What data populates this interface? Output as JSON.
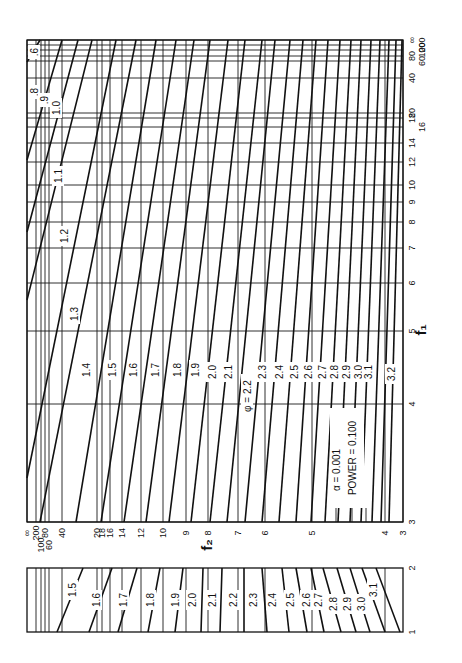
{
  "chart_data": {
    "type": "line",
    "orientation": "rotated 90° counter-clockwise",
    "annotation": {
      "alpha_label": "α = 0.001",
      "power_label": "POWER = 0.100"
    },
    "x_axis": {
      "label": "f₁",
      "scale": "log-like",
      "range": [
        3,
        "∞"
      ],
      "ticks": [
        "3",
        "4",
        "5",
        "6",
        "7",
        "8",
        "9",
        "10",
        "12",
        "14",
        "16",
        "18",
        "20",
        "40",
        "60",
        "80",
        "100",
        "200",
        "∞"
      ]
    },
    "y_axis": {
      "label": "f₂",
      "scale": "log-like",
      "range": [
        3,
        "∞"
      ],
      "ticks": [
        "∞",
        "200",
        "100",
        "80",
        "60",
        "40",
        "20",
        "18",
        "16",
        "14",
        "12",
        "10",
        "9",
        "8",
        "7",
        "6",
        "5",
        "4",
        "3"
      ]
    },
    "series_label_prefix": "φ =",
    "series": [
      {
        "name": "0.6"
      },
      {
        "name": "0.8"
      },
      {
        "name": "0.9"
      },
      {
        "name": "1.0"
      },
      {
        "name": "1.1"
      },
      {
        "name": "1.2"
      },
      {
        "name": "1.3"
      },
      {
        "name": "1.4"
      },
      {
        "name": "1.5"
      },
      {
        "name": "1.6"
      },
      {
        "name": "1.7"
      },
      {
        "name": "1.8"
      },
      {
        "name": "1.9"
      },
      {
        "name": "2.0"
      },
      {
        "name": "2.1"
      },
      {
        "name": "2.2"
      },
      {
        "name": "2.3"
      },
      {
        "name": "2.4"
      },
      {
        "name": "2.5"
      },
      {
        "name": "2.6"
      },
      {
        "name": "2.7"
      },
      {
        "name": "2.8"
      },
      {
        "name": "2.9"
      },
      {
        "name": "3.0"
      },
      {
        "name": "3.1"
      },
      {
        "name": "3.2"
      }
    ],
    "lower_panel": {
      "x_axis_ticks": [
        "1",
        "2"
      ],
      "y_axis": "f₂ (shared)",
      "series": [
        "1.5",
        "1.6",
        "1.7",
        "1.8",
        "1.9",
        "2.0",
        "2.1",
        "2.2",
        "2.3",
        "2.4",
        "2.5",
        "2.6",
        "2.7",
        "2.8",
        "2.9",
        "3.0",
        "3.1"
      ]
    },
    "grid": true,
    "legend": "inline curve labels"
  },
  "layout": {
    "main": {
      "left": 27,
      "top": 40,
      "right": 403,
      "bottom": 522
    },
    "lower": {
      "left": 27,
      "top": 568,
      "right": 403,
      "bottom": 632
    },
    "f1_ticks_y": [
      {
        "label": "∞",
        "y": 40
      },
      {
        "label": "200",
        "y": 45
      },
      {
        "label": "100",
        "y": 50
      },
      {
        "label": "80",
        "y": 56
      },
      {
        "label": "60",
        "y": 61
      },
      {
        "label": "40",
        "y": 78
      },
      {
        "label": "20",
        "y": 113
      },
      {
        "label": "18",
        "y": 118
      },
      {
        "label": "16",
        "y": 127
      },
      {
        "label": "14",
        "y": 143
      },
      {
        "label": "12",
        "y": 162
      },
      {
        "label": "10",
        "y": 185
      },
      {
        "label": "9",
        "y": 202
      },
      {
        "label": "8",
        "y": 222
      },
      {
        "label": "7",
        "y": 248
      },
      {
        "label": "6",
        "y": 283
      },
      {
        "label": "5",
        "y": 331
      },
      {
        "label": "4",
        "y": 404
      },
      {
        "label": "3",
        "y": 522
      }
    ],
    "f2_ticks_x": [
      {
        "label": "∞",
        "x": 27
      },
      {
        "label": "200",
        "x": 36
      },
      {
        "label": "100",
        "x": 41
      },
      {
        "label": "80",
        "x": 45
      },
      {
        "label": "60",
        "x": 49
      },
      {
        "label": "40",
        "x": 62
      },
      {
        "label": "20",
        "x": 97
      },
      {
        "label": "18",
        "x": 102
      },
      {
        "label": "16",
        "x": 110
      },
      {
        "label": "14",
        "x": 122
      },
      {
        "label": "12",
        "x": 141
      },
      {
        "label": "10",
        "x": 163
      },
      {
        "label": "9",
        "x": 186
      },
      {
        "label": "8",
        "x": 208
      },
      {
        "label": "7",
        "x": 238
      },
      {
        "label": "6",
        "x": 265
      },
      {
        "label": "5",
        "x": 312
      },
      {
        "label": "4",
        "x": 385
      },
      {
        "label": "3",
        "x": 403
      }
    ],
    "curves": [
      {
        "phi": "0.6",
        "x1": 27,
        "y1": 62,
        "x2": 40,
        "y2": 40,
        "lx": 34,
        "ly": 52,
        "label": ".6"
      },
      {
        "phi": "0.8",
        "x1": 27,
        "y1": 160,
        "x2": 62,
        "y2": 40,
        "lx": 34,
        "ly": 92,
        "label": ".8"
      },
      {
        "phi": "0.9",
        "x1": 27,
        "y1": 232,
        "x2": 78,
        "y2": 40,
        "lx": 44,
        "ly": 100,
        "label": ".9"
      },
      {
        "phi": "1.0",
        "x1": 27,
        "y1": 300,
        "x2": 92,
        "y2": 40,
        "lx": 56,
        "ly": 108,
        "label": "1.0"
      },
      {
        "phi": "1.1",
        "x1": 27,
        "y1": 478,
        "x2": 116,
        "y2": 40,
        "lx": 58,
        "ly": 176,
        "label": "1.1"
      },
      {
        "phi": "1.2",
        "x1": 40,
        "y1": 522,
        "x2": 136,
        "y2": 40,
        "lx": 64,
        "ly": 236,
        "label": "1.2"
      },
      {
        "phi": "1.3",
        "x1": 76,
        "y1": 522,
        "x2": 156,
        "y2": 40,
        "lx": 74,
        "ly": 314,
        "label": "1.3"
      },
      {
        "phi": "1.4",
        "x1": 101,
        "y1": 522,
        "x2": 176,
        "y2": 40,
        "lx": 86,
        "ly": 370,
        "label": "1.4"
      },
      {
        "phi": "1.5",
        "x1": 124,
        "y1": 522,
        "x2": 194,
        "y2": 40,
        "lx": 112,
        "ly": 370,
        "label": "1.5"
      },
      {
        "phi": "1.6",
        "x1": 146,
        "y1": 522,
        "x2": 210,
        "y2": 40,
        "lx": 133,
        "ly": 370,
        "label": "1.6"
      },
      {
        "phi": "1.7",
        "x1": 169,
        "y1": 522,
        "x2": 228,
        "y2": 40,
        "lx": 155,
        "ly": 370,
        "label": "1.7"
      },
      {
        "phi": "1.8",
        "x1": 191,
        "y1": 522,
        "x2": 245,
        "y2": 40,
        "lx": 177,
        "ly": 370,
        "label": "1.8"
      },
      {
        "phi": "1.9",
        "x1": 210,
        "y1": 522,
        "x2": 262,
        "y2": 40,
        "lx": 195,
        "ly": 370,
        "label": "1.9"
      },
      {
        "phi": "2.0",
        "x1": 227,
        "y1": 522,
        "x2": 275,
        "y2": 40,
        "lx": 212,
        "ly": 372,
        "label": "2.0"
      },
      {
        "phi": "2.1",
        "x1": 245,
        "y1": 522,
        "x2": 290,
        "y2": 40,
        "lx": 228,
        "ly": 372,
        "label": "2.1"
      },
      {
        "phi": "2.2",
        "x1": 262,
        "y1": 522,
        "x2": 303,
        "y2": 40,
        "lx": 247,
        "ly": 396,
        "label": "φ = 2.2"
      },
      {
        "phi": "2.3",
        "x1": 279,
        "y1": 522,
        "x2": 316,
        "y2": 40,
        "lx": 262,
        "ly": 372,
        "label": "2.3"
      },
      {
        "phi": "2.4",
        "x1": 296,
        "y1": 522,
        "x2": 328,
        "y2": 40,
        "lx": 279,
        "ly": 372,
        "label": "2.4"
      },
      {
        "phi": "2.5",
        "x1": 311,
        "y1": 522,
        "x2": 340,
        "y2": 40,
        "lx": 294,
        "ly": 372,
        "label": "2.5"
      },
      {
        "phi": "2.6",
        "x1": 325,
        "y1": 522,
        "x2": 351,
        "y2": 40,
        "lx": 308,
        "ly": 372,
        "label": "2.6"
      },
      {
        "phi": "2.7",
        "x1": 338,
        "y1": 522,
        "x2": 361,
        "y2": 40,
        "lx": 322,
        "ly": 372,
        "label": "2.7"
      },
      {
        "phi": "2.8",
        "x1": 350,
        "y1": 522,
        "x2": 371,
        "y2": 40,
        "lx": 334,
        "ly": 372,
        "label": "2.8"
      },
      {
        "phi": "2.9",
        "x1": 361,
        "y1": 522,
        "x2": 380,
        "y2": 40,
        "lx": 346,
        "ly": 372,
        "label": "2.9"
      },
      {
        "phi": "3.0",
        "x1": 372,
        "y1": 522,
        "x2": 389,
        "y2": 40,
        "lx": 358,
        "ly": 372,
        "label": "3.0"
      },
      {
        "phi": "3.1",
        "x1": 381,
        "y1": 522,
        "x2": 396,
        "y2": 40,
        "lx": 368,
        "ly": 372,
        "label": "3.1"
      },
      {
        "phi": "3.2",
        "x1": 389,
        "y1": 522,
        "x2": 402,
        "y2": 40,
        "lx": 391,
        "ly": 374,
        "label": "3.2"
      }
    ],
    "lower_curves": [
      {
        "phi": "1.5",
        "x1": 57,
        "y1": 632,
        "x2": 83,
        "y2": 568,
        "lx": 72,
        "ly": 590,
        "label": "1.5"
      },
      {
        "phi": "1.6",
        "x1": 89,
        "y1": 632,
        "x2": 112,
        "y2": 568,
        "lx": 96,
        "ly": 600,
        "label": "1.6"
      },
      {
        "phi": "1.7",
        "x1": 118,
        "y1": 632,
        "x2": 137,
        "y2": 568,
        "lx": 123,
        "ly": 600,
        "label": "1.7"
      },
      {
        "phi": "1.8",
        "x1": 148,
        "y1": 632,
        "x2": 160,
        "y2": 568,
        "lx": 150,
        "ly": 600,
        "label": "1.8"
      },
      {
        "phi": "1.9",
        "x1": 175,
        "y1": 632,
        "x2": 183,
        "y2": 568,
        "lx": 175,
        "ly": 600,
        "label": "1.9"
      },
      {
        "phi": "2.0",
        "x1": 201,
        "y1": 632,
        "x2": 203,
        "y2": 568,
        "lx": 192,
        "ly": 600,
        "label": "2.0"
      },
      {
        "phi": "2.1",
        "x1": 220,
        "y1": 632,
        "x2": 222,
        "y2": 568,
        "lx": 212,
        "ly": 600,
        "label": "2.1"
      },
      {
        "phi": "2.2",
        "x1": 244,
        "y1": 632,
        "x2": 244,
        "y2": 568,
        "lx": 233,
        "ly": 600,
        "label": "2.2"
      },
      {
        "phi": "2.3",
        "x1": 267,
        "y1": 632,
        "x2": 262,
        "y2": 568,
        "lx": 253,
        "ly": 600,
        "label": "2.3"
      },
      {
        "phi": "2.4",
        "x1": 289,
        "y1": 632,
        "x2": 282,
        "y2": 568,
        "lx": 272,
        "ly": 600,
        "label": "2.4"
      },
      {
        "phi": "2.5",
        "x1": 307,
        "y1": 632,
        "x2": 296,
        "y2": 568,
        "lx": 290,
        "ly": 600,
        "label": "2.5"
      },
      {
        "phi": "2.6",
        "x1": 324,
        "y1": 632,
        "x2": 311,
        "y2": 568,
        "lx": 306,
        "ly": 600,
        "label": "2.6"
      },
      {
        "phi": "2.7",
        "x1": 341,
        "y1": 632,
        "x2": 323,
        "y2": 568,
        "lx": 318,
        "ly": 600,
        "label": "2.7"
      },
      {
        "phi": "2.8",
        "x1": 356,
        "y1": 632,
        "x2": 337,
        "y2": 568,
        "lx": 333,
        "ly": 604,
        "label": "2.8"
      },
      {
        "phi": "2.9",
        "x1": 370,
        "y1": 632,
        "x2": 350,
        "y2": 568,
        "lx": 347,
        "ly": 604,
        "label": "2.9"
      },
      {
        "phi": "3.0",
        "x1": 385,
        "y1": 632,
        "x2": 362,
        "y2": 568,
        "lx": 361,
        "ly": 604,
        "label": "3.0"
      },
      {
        "phi": "3.1",
        "x1": 400,
        "y1": 632,
        "x2": 376,
        "y2": 568,
        "lx": 373,
        "ly": 590,
        "label": "3.1"
      }
    ],
    "lower_vlines": [
      36,
      41,
      45,
      49,
      62,
      97,
      102,
      110,
      122,
      141,
      163,
      186,
      208,
      238,
      265,
      312,
      385
    ],
    "lower_x_ticks": [
      {
        "label": "2",
        "y": 568
      },
      {
        "label": "1",
        "y": 632
      }
    ],
    "f1_title": {
      "text": "f₁",
      "x": 426,
      "y": 330
    },
    "f2_title": {
      "text": "f₂",
      "x": 212,
      "y": 545
    },
    "annotation_pos": {
      "x": 352,
      "y": 470
    }
  }
}
